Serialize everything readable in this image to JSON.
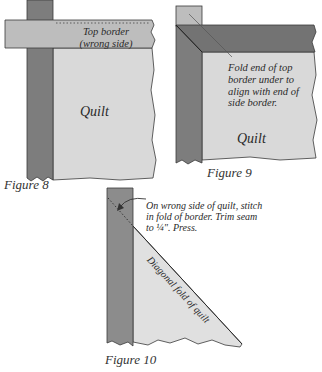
{
  "colors": {
    "side_border": "#7d7d7d",
    "quilt": "#d9d9d9",
    "top_border_light": "#bdbdbd",
    "top_border_dark": "#737373",
    "outline": "#3a3a3a",
    "text": "#2a2a2a"
  },
  "figures": [
    {
      "caption": "Figure 8",
      "labels": {
        "top_border_line1": "Top border",
        "top_border_line2": "(wrong side)",
        "quilt": "Quilt"
      }
    },
    {
      "caption": "Figure 9",
      "labels": {
        "note_line1": "Fold end of top",
        "note_line2": "border under to",
        "note_line3": "align with end of",
        "note_line4": "side border.",
        "quilt": "Quilt"
      }
    },
    {
      "caption": "Figure 10",
      "labels": {
        "note_line1": "On wrong side of quilt, stitch",
        "note_line2": "in fold of border. Trim seam",
        "note_line3": "to ¼\". Press.",
        "diagonal": "Diagonal fold of quilt"
      }
    }
  ]
}
